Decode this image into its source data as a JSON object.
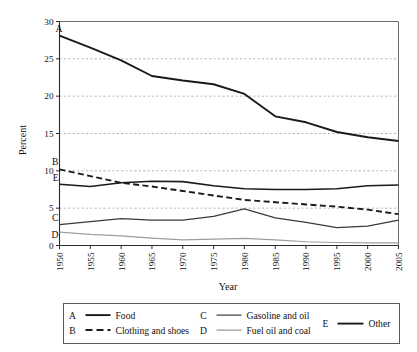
{
  "chart_data": {
    "type": "line",
    "title": "",
    "xlabel": "Year",
    "ylabel": "Percent",
    "xlim": [
      1950,
      2005
    ],
    "ylim": [
      0,
      30
    ],
    "yticks": [
      0,
      5,
      10,
      15,
      20,
      25,
      30
    ],
    "xticks": [
      1950,
      1955,
      1960,
      1965,
      1970,
      1975,
      1980,
      1985,
      1990,
      1995,
      2000,
      2005
    ],
    "grid": "horizontal-dashed",
    "legend_position": "below-plot",
    "x": [
      1950,
      1955,
      1960,
      1965,
      1970,
      1975,
      1980,
      1985,
      1990,
      1995,
      2000,
      2005
    ],
    "series": [
      {
        "key": "A",
        "name": "Food",
        "style": "solid",
        "color": "#1a1a1a",
        "width": 1.9,
        "values": [
          28.1,
          26.5,
          24.8,
          22.7,
          22.1,
          21.6,
          20.3,
          17.3,
          16.5,
          15.2,
          14.5,
          14.0
        ]
      },
      {
        "key": "B",
        "name": "Clothing and shoes",
        "style": "dashed",
        "color": "#1a1a1a",
        "width": 1.9,
        "values": [
          10.2,
          9.3,
          8.4,
          7.9,
          7.3,
          6.7,
          6.1,
          5.8,
          5.5,
          5.2,
          4.8,
          4.2
        ]
      },
      {
        "key": "C",
        "name": "Gasoline and oil",
        "style": "solid",
        "color": "#3a3a3a",
        "width": 1.2,
        "values": [
          2.8,
          3.2,
          3.6,
          3.4,
          3.4,
          3.9,
          4.9,
          3.7,
          3.1,
          2.4,
          2.6,
          3.4
        ]
      },
      {
        "key": "D",
        "name": "Fuel oil and coal",
        "style": "solid",
        "color": "#9d9d9d",
        "width": 1.2,
        "values": [
          1.8,
          1.5,
          1.3,
          1.0,
          0.75,
          0.85,
          0.95,
          0.75,
          0.5,
          0.4,
          0.35,
          0.35
        ]
      },
      {
        "key": "E",
        "name": "Other",
        "style": "solid",
        "color": "#1a1a1a",
        "width": 1.6,
        "values": [
          8.2,
          7.9,
          8.4,
          8.6,
          8.55,
          8.0,
          7.6,
          7.5,
          7.5,
          7.6,
          8.0,
          8.1
        ]
      }
    ]
  },
  "axis": {
    "ylabel": "Percent",
    "xlabel": "Year",
    "ytick_labels": [
      "0",
      "5",
      "10",
      "15",
      "20",
      "25",
      "30"
    ],
    "xtick_labels": [
      "1950",
      "1955",
      "1960",
      "1965",
      "1970",
      "1975",
      "1980",
      "1985",
      "1990",
      "1995",
      "2000",
      "2005"
    ]
  },
  "inline_labels": [
    {
      "key": "A",
      "label": "A"
    },
    {
      "key": "B",
      "label": "B"
    },
    {
      "key": "C",
      "label": "C"
    },
    {
      "key": "D",
      "label": "D"
    },
    {
      "key": "E",
      "label": "E"
    }
  ],
  "legend": {
    "entries": [
      {
        "key": "A",
        "key_label": "A",
        "label": "Food",
        "style": "solid",
        "color": "#1a1a1a",
        "width": 1.9
      },
      {
        "key": "B",
        "key_label": "B",
        "label": "Clothing and shoes",
        "style": "dashed",
        "color": "#1a1a1a",
        "width": 2.0
      },
      {
        "key": "C",
        "key_label": "C",
        "label": "Gasoline and oil",
        "style": "solid",
        "color": "#3a3a3a",
        "width": 1.2
      },
      {
        "key": "D",
        "key_label": "D",
        "label": "Fuel oil and coal",
        "style": "solid",
        "color": "#9d9d9d",
        "width": 1.3
      },
      {
        "key": "E",
        "key_label": "E",
        "label": "Other",
        "style": "solid",
        "color": "#1a1a1a",
        "width": 1.9
      }
    ]
  },
  "colors": {
    "background": "#ffffff",
    "axis": "#2a2a2a",
    "grid": "#9a9a9a",
    "frame": "#6e6e6e",
    "text": "#111111"
  }
}
